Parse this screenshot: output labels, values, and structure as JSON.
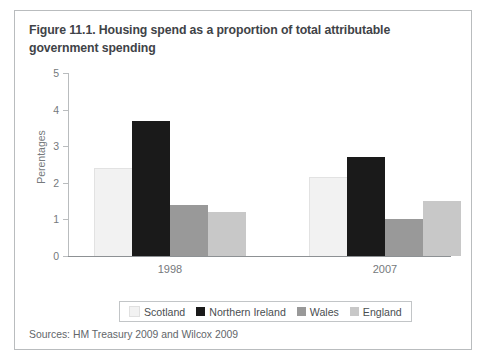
{
  "figure": {
    "title": "Figure 11.1. Housing spend as a proportion of total attributable government spending",
    "source_note": "Sources: HM Treasury 2009 and Wilcox 2009"
  },
  "legend": {
    "items": [
      {
        "label": "Scotland",
        "color": "#f2f2f2"
      },
      {
        "label": "Northern Ireland",
        "color": "#1a1a1a"
      },
      {
        "label": "Wales",
        "color": "#999999"
      },
      {
        "label": "England",
        "color": "#c8c8c8"
      }
    ]
  },
  "chart_data": {
    "type": "bar",
    "title": "Figure 11.1. Housing spend as a proportion of total attributable government spending",
    "xlabel": "",
    "ylabel": "Perentages",
    "ylim": [
      0,
      5
    ],
    "yticks": [
      "0",
      "1",
      "2",
      "3",
      "4",
      "5"
    ],
    "grid": false,
    "legend_position": "bottom",
    "categories": [
      "1998",
      "2007"
    ],
    "series": [
      {
        "name": "Scotland",
        "color": "#f2f2f2",
        "values": [
          2.4,
          2.15
        ]
      },
      {
        "name": "Northern Ireland",
        "color": "#1a1a1a",
        "values": [
          3.7,
          2.7
        ]
      },
      {
        "name": "Wales",
        "color": "#999999",
        "values": [
          1.4,
          1.0
        ]
      },
      {
        "name": "England",
        "color": "#c8c8c8",
        "values": [
          1.2,
          1.5
        ]
      }
    ]
  }
}
